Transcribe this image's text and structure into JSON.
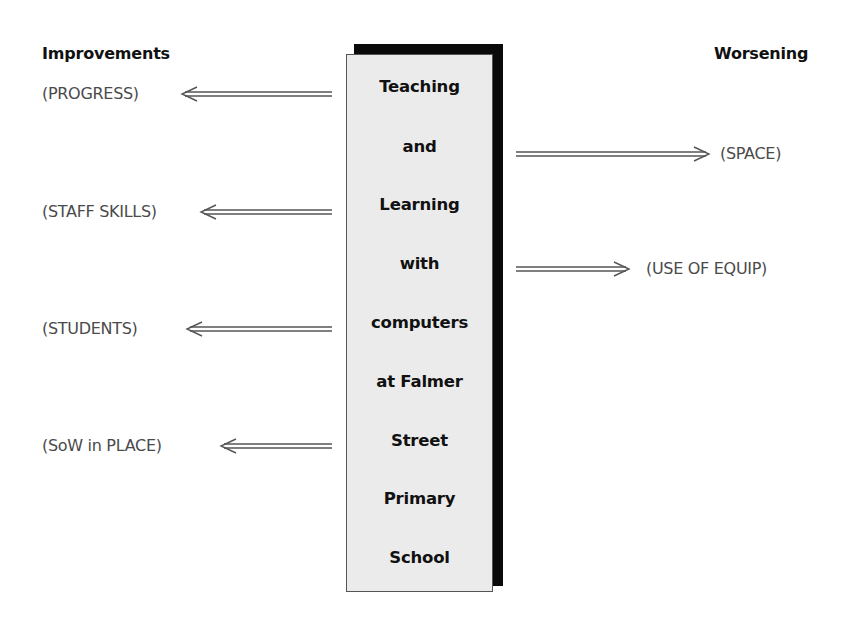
{
  "headings": {
    "left": "Improvements",
    "right": "Worsening"
  },
  "center": {
    "lines": [
      "Teaching",
      "and",
      "Learning",
      "with",
      "computers",
      "at Falmer",
      "Street",
      "Primary",
      "School"
    ]
  },
  "improvements": [
    {
      "label": "(PROGRESS)",
      "arrow": "left-double-arrow-icon"
    },
    {
      "label": "(STAFF SKILLS)",
      "arrow": "left-double-arrow-icon"
    },
    {
      "label": "(STUDENTS)",
      "arrow": "left-double-arrow-icon"
    },
    {
      "label": "(SoW in PLACE)",
      "arrow": "left-double-arrow-icon"
    }
  ],
  "worsening": [
    {
      "label": "(SPACE)",
      "arrow": "right-double-arrow-icon"
    },
    {
      "label": "(USE OF EQUIP)",
      "arrow": "right-double-arrow-icon"
    }
  ],
  "colors": {
    "box_fill": "#ebebeb",
    "box_shadow": "#0a0a0a",
    "text_dark": "#111111",
    "text_label": "#4a4a4a",
    "arrow": "#555555"
  }
}
